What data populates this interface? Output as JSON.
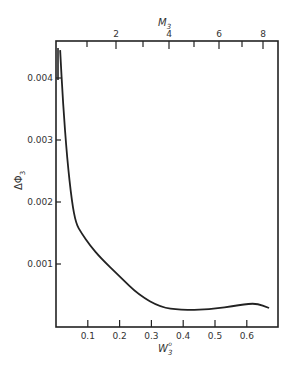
{
  "chart_data": {
    "type": "line",
    "title": "",
    "xlabel": "W3°",
    "ylabel": "ΔΦ3",
    "x2label": "M3",
    "xlim": [
      0,
      0.7
    ],
    "ylim": [
      0,
      0.0048
    ],
    "grid": false,
    "legend": "none",
    "x_ticks": [
      "0.1",
      "0.2",
      "0.3",
      "0.4",
      "0.5",
      "0.6"
    ],
    "y_ticks": [
      "0.001",
      "0.002",
      "0.003",
      "0.004"
    ],
    "x2_ticks": [
      "2",
      "4",
      "6",
      "8"
    ],
    "series": [
      {
        "name": "ΔΦ3",
        "x": [
          0.013,
          0.022,
          0.035,
          0.05,
          0.063,
          0.08,
          0.107,
          0.14,
          0.2,
          0.26,
          0.33,
          0.39,
          0.48,
          0.58,
          0.63,
          0.67
        ],
        "values": [
          0.00445,
          0.0036,
          0.0027,
          0.002,
          0.00165,
          0.0015,
          0.0013,
          0.0011,
          0.0008,
          0.0005,
          0.0003,
          0.00026,
          0.00026,
          0.00034,
          0.00037,
          0.00029
        ]
      }
    ]
  },
  "labels": {
    "xlabel": "W",
    "xlabel_sub": "3",
    "xlabel_sup": "o",
    "ylabel": "ΔΦ",
    "ylabel_sub": "3",
    "x2label": "M",
    "x2label_sub": "3"
  }
}
